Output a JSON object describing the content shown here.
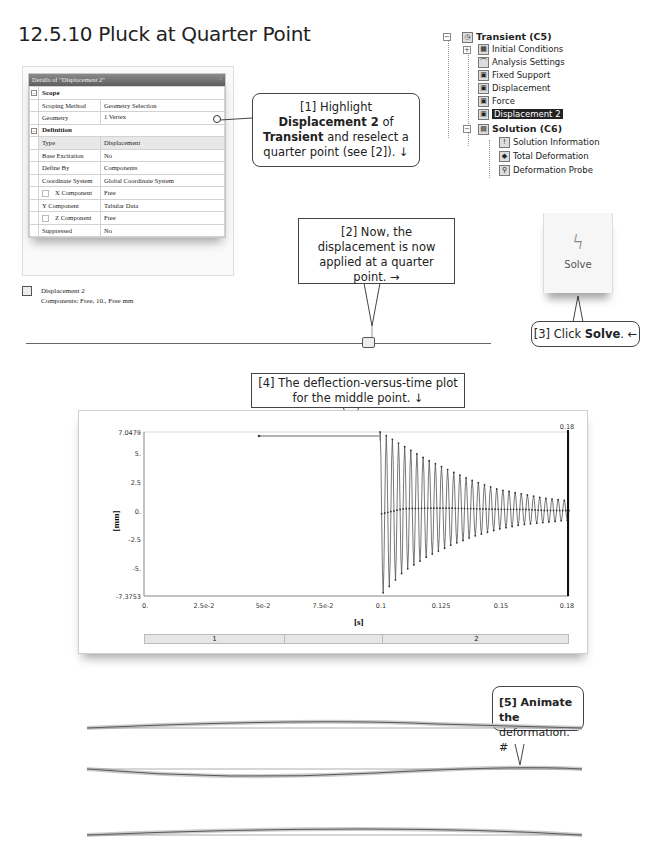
{
  "section": {
    "title": "12.5.10 Pluck at Quarter Point"
  },
  "details": {
    "header": "Details of \"Displacement 2\"",
    "pin": "↓",
    "groups": [
      {
        "name": "Scope",
        "rows": [
          {
            "key": "Scoping Method",
            "value": "Geometry Selection"
          },
          {
            "key": "Geometry",
            "value": "1 Vertex"
          }
        ]
      },
      {
        "name": "Definition",
        "rows": [
          {
            "key": "Type",
            "value": "Displacement"
          },
          {
            "key": "Base Excitation",
            "value": "No"
          },
          {
            "key": "Define By",
            "value": "Components"
          },
          {
            "key": "Coordinate System",
            "value": "Global Coordinate System"
          },
          {
            "key": "X Component",
            "value": "Free"
          },
          {
            "key": "Y Component",
            "value": "Tabular Data"
          },
          {
            "key": "Z Component",
            "value": "Free"
          },
          {
            "key": "Suppressed",
            "value": "No"
          }
        ]
      }
    ]
  },
  "legend": {
    "name": "Displacement 2",
    "detail": "Components: Free, 10., Free mm"
  },
  "tree": {
    "root": "Transient (C5)",
    "items": [
      "Initial Conditions",
      "Analysis Settings",
      "Fixed Support",
      "Displacement",
      "Force",
      "Displacement 2"
    ],
    "solution": "Solution (C6)",
    "solution_items": [
      "Solution Information",
      "Total Deformation",
      "Deformation Probe"
    ]
  },
  "solve": {
    "label": "Solve"
  },
  "callouts": {
    "c1": {
      "line1": "[1] Highlight",
      "b1": "Displacement 2",
      "t1": " of",
      "b2": "Transient",
      "t2": " and reselect a",
      "line4": "quarter point (see [2]). ↓"
    },
    "c2": {
      "text": "[2] Now, the displacement is now applied at a quarter point. →"
    },
    "c3": {
      "pre": "[3] Click ",
      "bold": "Solve",
      "post": ". ←"
    },
    "c4": {
      "text": "[4] The deflection-versus-time plot for the middle point. ↓"
    },
    "c5": {
      "line1": "[5] Animate the",
      "line2": "deformation. #"
    }
  },
  "chart_data": {
    "type": "line",
    "title": "",
    "xlabel": "[s]",
    "ylabel": "[mm]",
    "xlim": [
      0,
      0.18
    ],
    "ylim": [
      -7.3753,
      7.0479
    ],
    "x_ticks": [
      "0.",
      "2.5e-2",
      "5e-2",
      "7.5e-2",
      "0.1",
      "0.125",
      "0.15",
      "0.18"
    ],
    "y_ticks": [
      "7.0479",
      "5.",
      "2.5",
      "0.",
      "-2.5",
      "-5.",
      "-7.3753"
    ],
    "marker_label": "0.18",
    "series": [
      {
        "name": "Deformation Probe (Y, middle point)",
        "description": "Held at ~6.3 mm from t=0.05 to t=0.1 s, then released: decaying oscillation from about ±7.2 mm down to about ±1 mm at t=0.18 s",
        "x": [
          0.05,
          0.1,
          0.1,
          0.11,
          0.12,
          0.13,
          0.14,
          0.15,
          0.16,
          0.17,
          0.18
        ],
        "envelope_upper": [
          6.3,
          6.3,
          7.05,
          5.8,
          4.6,
          3.6,
          2.7,
          2.0,
          1.6,
          1.2,
          1.0
        ],
        "envelope_lower": [
          6.3,
          6.3,
          -7.38,
          -5.2,
          -3.9,
          -2.9,
          -2.1,
          -1.5,
          -1.1,
          -0.9,
          -0.7
        ]
      }
    ],
    "step_bar": [
      "1",
      "2"
    ],
    "grid": false
  },
  "animation": {
    "frames": 3
  }
}
